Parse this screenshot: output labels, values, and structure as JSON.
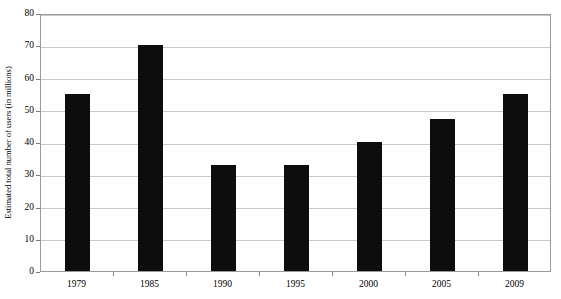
{
  "chart_data": {
    "type": "bar",
    "title": "",
    "xlabel": "",
    "ylabel": "Estimated total number of users (in millions)",
    "categories": [
      "1979",
      "1985",
      "1990",
      "1995",
      "2000",
      "2005",
      "2009"
    ],
    "values": [
      55,
      70,
      33,
      33,
      40,
      47,
      55
    ],
    "series": [
      {
        "name": "Estimated total number of users (in millions)",
        "values": [
          55,
          70,
          33,
          33,
          40,
          47,
          55
        ]
      }
    ],
    "ylim": [
      0,
      80
    ],
    "y_ticks": [
      0,
      10,
      20,
      30,
      40,
      50,
      60,
      70,
      80
    ],
    "y_tick_labels": [
      "0",
      "10",
      "20",
      "30",
      "40",
      "50",
      "60",
      "70",
      "80"
    ],
    "grid": true,
    "grid_axis": "y",
    "legend": false,
    "legend_position": "none",
    "bar_color": "#0d0d0d",
    "grid_color": "#c9c9c9",
    "axis_color": "#9a9a9a",
    "background_color": "#ffffff",
    "cut_off_header_text": ""
  }
}
